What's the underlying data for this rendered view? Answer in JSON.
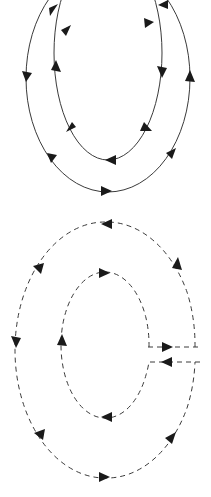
{
  "canvas": {
    "width": 211,
    "height": 497,
    "background": "#ffffff",
    "title": "Nested circulation loop diagram"
  },
  "style": {
    "stroke_color": "#3a3a3a",
    "arrow_color": "#1a1a1a",
    "stroke_width": 1.0,
    "dash_pattern": "5 4",
    "arrow_length": 9,
    "arrow_width": 7
  },
  "chart_data": {
    "type": "diagram",
    "groups": [
      {
        "name": "upper-solid-group",
        "line_style": "solid",
        "loops": [
          {
            "name": "upper-outer-loop",
            "shape": "ellipse",
            "cx": 108,
            "cy": 78,
            "rx": 82,
            "ry": 114,
            "direction": "clockwise",
            "arrow_count": 6,
            "arrows": [
              "top-left",
              "left-down",
              "bottom-right",
              "right-up",
              "top-right-in",
              "bottom-center-right"
            ]
          },
          {
            "name": "upper-inner-loop",
            "shape": "ellipse",
            "cx": 108,
            "cy": 53,
            "rx": 54,
            "ry": 107,
            "direction": "counterclockwise",
            "arrow_count": 6,
            "arrows": [
              "top-left-up",
              "left-up",
              "bottom-left",
              "bottom-center-left",
              "right-down",
              "top-right-down"
            ]
          }
        ]
      },
      {
        "name": "lower-dashed-group",
        "line_style": "dashed",
        "loops": [
          {
            "name": "lower-outer-loop",
            "shape": "ellipse",
            "cx": 105,
            "cy": 350,
            "rx": 90,
            "ry": 128,
            "direction": "counterclockwise",
            "arrow_count": 6,
            "arrows": [
              "top-center-left",
              "upper-left",
              "left-down",
              "lower-left",
              "bottom-right",
              "right-up"
            ]
          },
          {
            "name": "lower-inner-loop",
            "shape": "ellipse",
            "cx": 105,
            "cy": 345,
            "rx": 44,
            "ry": 73,
            "direction": "clockwise",
            "arrow_count": 3,
            "arrows": [
              "top-right",
              "left-up",
              "bottom-left"
            ]
          }
        ],
        "connectors": [
          {
            "name": "connector-outbound",
            "orientation": "horizontal",
            "y": 347,
            "x_start": 148,
            "x_end": 200,
            "direction": "right"
          },
          {
            "name": "connector-inbound",
            "orientation": "horizontal",
            "y": 362,
            "x_start": 200,
            "x_end": 148,
            "direction": "left"
          }
        ]
      }
    ]
  }
}
